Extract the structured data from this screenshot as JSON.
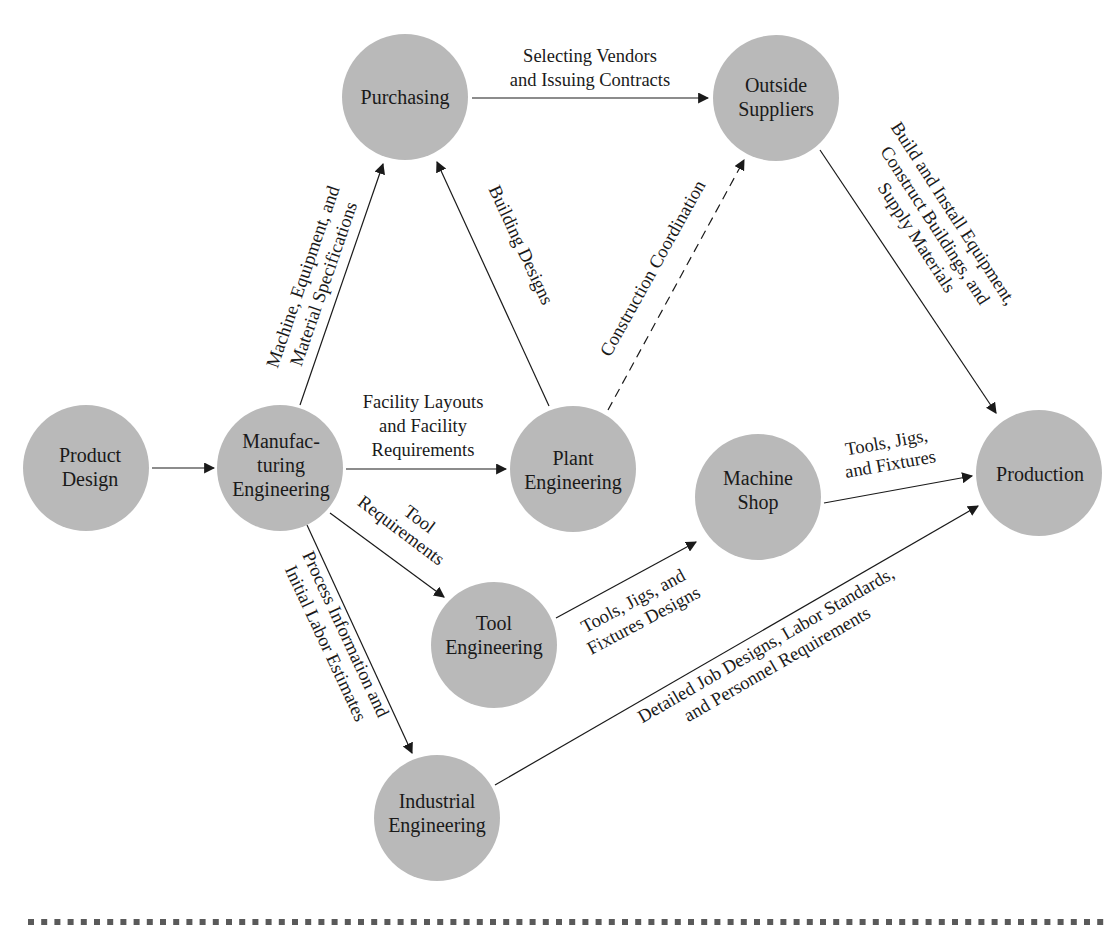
{
  "nodes": {
    "purchasing": {
      "lines": [
        "Purchasing"
      ],
      "cx": 405,
      "cy": 97
    },
    "outside_suppliers": {
      "lines": [
        "Outside",
        "Suppliers"
      ],
      "cx": 776,
      "cy": 98
    },
    "product_design": {
      "lines": [
        "Product",
        "Design"
      ],
      "cx": 86,
      "cy": 468
    },
    "manufacturing_engineering": {
      "lines": [
        "Manufac-",
        "turing",
        "Engineering"
      ],
      "cx": 280,
      "cy": 468
    },
    "plant_engineering": {
      "lines": [
        "Plant",
        "Engineering"
      ],
      "cx": 573,
      "cy": 469
    },
    "machine_shop": {
      "lines": [
        "Machine",
        "Shop"
      ],
      "cx": 758,
      "cy": 497
    },
    "production": {
      "lines": [
        "Production"
      ],
      "cx": 1039,
      "cy": 473
    },
    "tool_engineering": {
      "lines": [
        "Tool",
        "Engineering"
      ],
      "cx": 494,
      "cy": 645
    },
    "industrial_engineering": {
      "lines": [
        "Industrial",
        "Engineering"
      ],
      "cx": 437,
      "cy": 818
    }
  },
  "edges": {
    "purchasing_to_suppliers": {
      "lines": [
        "Selecting Vendors",
        "and Issuing Contracts"
      ]
    },
    "mfg_to_purchasing": {
      "lines": [
        "Machine, Equipment, and",
        "Material Specifications"
      ]
    },
    "plant_to_purchasing": {
      "lines": [
        "Building Designs"
      ]
    },
    "plant_to_suppliers": {
      "lines": [
        "Construction Coordination"
      ],
      "style": "dashed"
    },
    "suppliers_to_production": {
      "lines": [
        "Build and Install Equipment,",
        "Construct Buildings, and",
        "Supply Materials"
      ]
    },
    "product_to_mfg": {
      "lines": []
    },
    "mfg_to_plant": {
      "lines": [
        "Facility Layouts",
        "and Facility",
        "Requirements"
      ]
    },
    "mfg_to_tool": {
      "lines": [
        "Tool",
        "Requirements"
      ]
    },
    "mfg_to_industrial": {
      "lines": [
        "Process Information and",
        "Initial Labor Estimates"
      ]
    },
    "tool_to_machine": {
      "lines": [
        "Tools, Jigs, and",
        "Fixtures Designs"
      ]
    },
    "machine_to_production": {
      "lines": [
        "Tools, Jigs,",
        "and Fixtures"
      ]
    },
    "industrial_to_production": {
      "lines": [
        "Detailed Job Designs, Labor Standards,",
        "and Personnel Requirements"
      ]
    }
  },
  "colors": {
    "node_fill": "#b9b9b9",
    "line": "#1a1a1a",
    "footer_dots": "#5a5a5a"
  }
}
